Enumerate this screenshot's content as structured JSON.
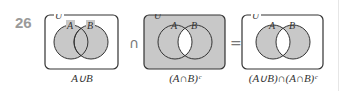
{
  "problem_number": "26",
  "diagrams": [
    {
      "universe": "U",
      "set_a": "A",
      "set_b": "B",
      "shading": "A∪B",
      "caption": "A∪B"
    },
    {
      "universe": "U",
      "set_a": "A",
      "set_b": "B",
      "shading": "(A∩B)^c",
      "caption": "(A∩B)ᶜ"
    },
    {
      "universe": "U",
      "set_a": "A",
      "set_b": "B",
      "shading": "symmetric difference",
      "caption": "(A∪B)∩(A∩B)ᶜ"
    }
  ],
  "operators": [
    "∩",
    "="
  ],
  "colors": {
    "shade": "#c8c8c8",
    "stroke": "#333333",
    "number": "#9a9a9a"
  }
}
